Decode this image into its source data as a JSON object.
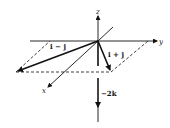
{
  "diagram": {
    "type": "3d-vector-diagram",
    "axes": {
      "x": {
        "label": "x"
      },
      "y": {
        "label": "y"
      },
      "z": {
        "label": "z"
      }
    },
    "vectors": [
      {
        "id": "i_minus_j",
        "label": "i − j"
      },
      {
        "id": "i_plus_j",
        "label": "i + j"
      },
      {
        "id": "minus_2k",
        "label": "−2k"
      }
    ],
    "construction": {
      "style": "dashed parallelogram in xy-plane"
    },
    "colors": {
      "stroke": "#111111",
      "background": "#ffffff"
    }
  }
}
